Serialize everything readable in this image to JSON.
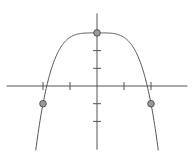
{
  "chart_data": {
    "type": "line",
    "title": "",
    "xlabel": "",
    "ylabel": "",
    "function": "y = 3 - x^4/4",
    "xlim": [
      -3.35,
      3.35
    ],
    "ylim": [
      -3.6,
      4.1
    ],
    "grid": false,
    "legend": null,
    "x_ticks": [
      -2,
      -1,
      1,
      2
    ],
    "y_ticks": [
      -2,
      -1,
      1,
      2
    ],
    "tick_labels_shown": false,
    "series": [
      {
        "name": "curve",
        "color": "#555555",
        "x_range": [
          -2.27,
          2.27
        ]
      }
    ],
    "points": [
      {
        "x": 0,
        "y": 3
      },
      {
        "x": -2,
        "y": -1
      },
      {
        "x": 2,
        "y": -1
      }
    ],
    "point_fill": "#999999",
    "point_stroke": "#555555",
    "axis_color": "#555555"
  }
}
